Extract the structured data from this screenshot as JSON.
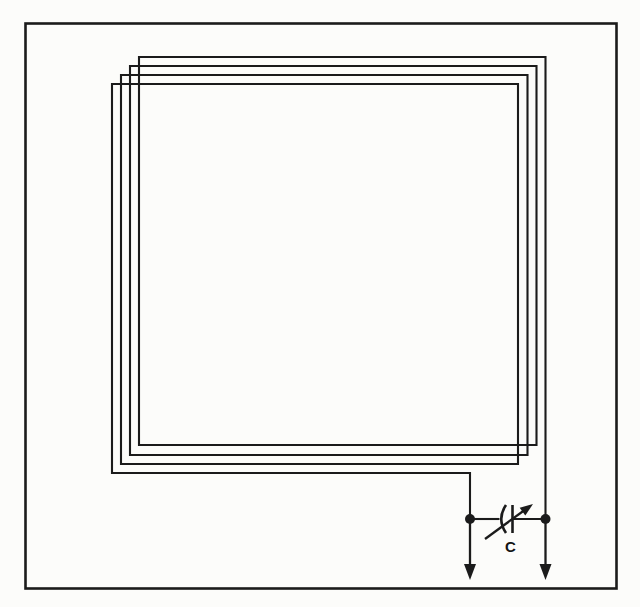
{
  "diagram": {
    "kind": "loop-antenna-schematic",
    "loop": {
      "turns": 4
    },
    "capacitor": {
      "label": "C",
      "type": "variable-capacitor"
    },
    "icons": [
      "variable-arrow-icon",
      "terminal-arrow-left-icon",
      "terminal-arrow-right-icon",
      "junction-node-left",
      "junction-node-right"
    ],
    "colors": {
      "line": "#1b1b1b",
      "background": "#fcfcfa"
    }
  }
}
